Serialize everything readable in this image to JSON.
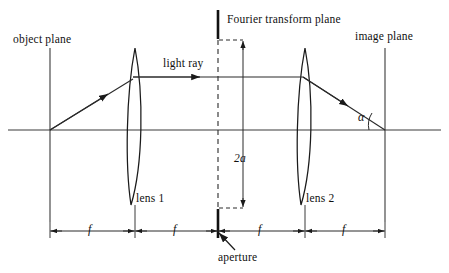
{
  "figure": {
    "background_color": "#ffffff",
    "stroke_color": "#1a1a1a",
    "width": 449,
    "height": 273
  },
  "labels": {
    "object_plane": "object plane",
    "fourier_plane": "Fourier transform plane",
    "image_plane": "image plane",
    "light_ray": "light ray",
    "lens1": "lens 1",
    "lens2": "lens 2",
    "aperture": "aperture",
    "aperture_size": "2a",
    "angle": "α"
  },
  "dimensions": {
    "segment_label": "f",
    "segments": [
      {
        "label": "f",
        "from": "object plane",
        "to": "lens 1"
      },
      {
        "label": "f",
        "from": "lens 1",
        "to": "Fourier transform plane"
      },
      {
        "label": "f",
        "from": "Fourier transform plane",
        "to": "lens 2"
      },
      {
        "label": "f",
        "from": "lens 2",
        "to": "image plane"
      }
    ]
  },
  "elements": {
    "optical_axis_y": 130,
    "object_plane_x": 50,
    "lens1_x": 135,
    "fourier_plane_x": 218,
    "lens2_x": 305,
    "image_plane_x": 385,
    "ray_height_y": 77,
    "aperture_half_height": "a"
  }
}
